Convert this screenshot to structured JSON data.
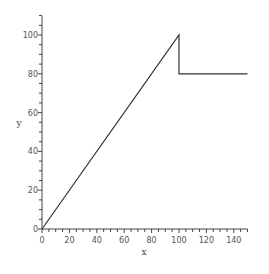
{
  "chart_data": {
    "type": "line",
    "title": "",
    "xlabel": "x",
    "ylabel": "y",
    "xlim": [
      0,
      150
    ],
    "ylim": [
      0,
      110
    ],
    "x_ticks": [
      0,
      20,
      40,
      60,
      80,
      100,
      120,
      140
    ],
    "y_ticks": [
      0,
      20,
      40,
      60,
      80,
      100
    ],
    "x_minor_step": 5,
    "y_minor_step": 5,
    "grid": false,
    "legend": null,
    "series": [
      {
        "name": "y",
        "color": "#333333",
        "points": [
          [
            0,
            0
          ],
          [
            100,
            100
          ],
          [
            100,
            80
          ],
          [
            150,
            80
          ]
        ]
      }
    ]
  }
}
